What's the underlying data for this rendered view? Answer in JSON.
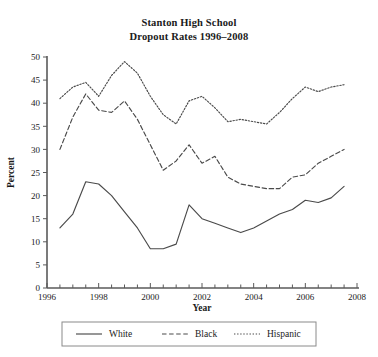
{
  "figure": {
    "title_line1": "Stanton High School",
    "title_line2": "Dropout Rates 1996–2008"
  },
  "axes": {
    "ylabel": "Percent",
    "xlabel": "Year",
    "ytick_labels": [
      "0",
      "5",
      "10",
      "15",
      "20",
      "25",
      "30",
      "35",
      "40",
      "45",
      "50"
    ],
    "xtick_labels": [
      "1996",
      "1998",
      "2000",
      "2002",
      "2004",
      "2006",
      "2008"
    ]
  },
  "legend": {
    "items": [
      {
        "label": "White",
        "dash": "none"
      },
      {
        "label": "Black",
        "dash": "dashed"
      },
      {
        "label": "Hispanic",
        "dash": "dotted"
      }
    ]
  },
  "colors": {
    "line": "#4a4a4a",
    "axis": "#5a5a5a",
    "text": "#1a1a1a",
    "legend_border": "#8a8a8a",
    "background": "#ffffff"
  },
  "chart_data": {
    "type": "line",
    "title": "Stanton High School Dropout Rates 1996–2008",
    "xlabel": "Year",
    "ylabel": "Percent",
    "xlim": [
      1996,
      2008
    ],
    "ylim": [
      0,
      50
    ],
    "ytick_step": 5,
    "xtick_step": 2,
    "xtick_minor_step": 0.5,
    "grid": false,
    "legend_position": "below",
    "x": [
      1996.5,
      1997.0,
      1997.5,
      1998.0,
      1998.5,
      1999.0,
      1999.5,
      2000.0,
      2000.5,
      2001.0,
      2001.5,
      2002.0,
      2002.5,
      2003.0,
      2003.5,
      2004.0,
      2004.5,
      2005.0,
      2005.5,
      2006.0,
      2006.5,
      2007.0,
      2007.5
    ],
    "series": [
      {
        "name": "White",
        "style": "solid",
        "values": [
          13.0,
          16.0,
          23.0,
          22.5,
          20.0,
          16.5,
          13.0,
          8.5,
          8.5,
          9.5,
          18.0,
          15.0,
          14.0,
          13.0,
          12.0,
          13.0,
          14.5,
          16.0,
          17.0,
          19.0,
          18.5,
          19.5,
          22.0
        ]
      },
      {
        "name": "Black",
        "style": "dashed",
        "values": [
          30.0,
          37.0,
          42.0,
          38.5,
          38.0,
          40.5,
          36.5,
          31.0,
          25.5,
          27.5,
          31.0,
          27.0,
          28.5,
          24.0,
          22.5,
          22.0,
          21.5,
          21.5,
          24.0,
          24.5,
          27.0,
          28.5,
          30.0
        ]
      },
      {
        "name": "Hispanic",
        "style": "dotted",
        "values": [
          41.0,
          43.5,
          44.5,
          41.5,
          46.0,
          49.0,
          46.5,
          41.5,
          37.5,
          35.5,
          40.5,
          41.5,
          39.0,
          36.0,
          36.5,
          36.0,
          35.5,
          38.0,
          41.0,
          43.5,
          42.5,
          43.5,
          44.0
        ]
      }
    ]
  }
}
